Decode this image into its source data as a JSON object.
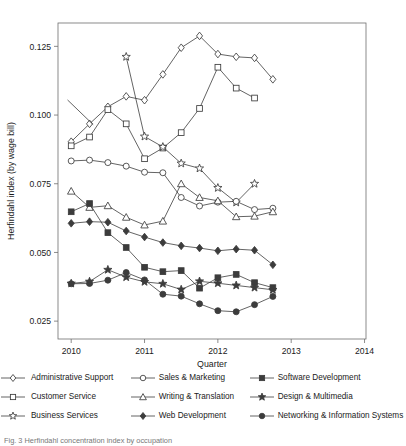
{
  "chart_data": {
    "type": "line",
    "title": "",
    "xlabel": "Quarter",
    "ylabel": "Herfindahl index (by wage bill)",
    "xlim": [
      2009.82,
      2014.02
    ],
    "ylim": [
      0.0185,
      0.1335
    ],
    "xticks": [
      2010,
      2011,
      2012,
      2013,
      2014
    ],
    "xticklabels": [
      "2010",
      "2011",
      "2012",
      "2013",
      "2014"
    ],
    "yticks": [
      0.025,
      0.05,
      0.075,
      0.1,
      0.125
    ],
    "yticklabels": [
      "0.025",
      "0.050",
      "0.075",
      "0.100",
      "0.125"
    ],
    "grid": false,
    "legend_position": "below",
    "annotation_leader_line": {
      "x1": 2009.95,
      "y1": 0.1055,
      "x2": 2010.3,
      "y2": 0.0965
    },
    "x": [
      2010.0,
      2010.25,
      2010.5,
      2010.75,
      2011.0,
      2011.25,
      2011.5,
      2011.75,
      2012.0,
      2012.25,
      2012.5,
      2012.75
    ],
    "series": [
      {
        "name": "Administrative Support",
        "marker": "open-diamond",
        "values": [
          0.0903,
          0.0968,
          0.103,
          0.1068,
          0.1054,
          0.1148,
          0.1245,
          0.1288,
          0.1222,
          0.1212,
          0.1208,
          0.113
        ]
      },
      {
        "name": "Customer Service",
        "marker": "open-square",
        "values": [
          0.0888,
          0.092,
          0.102,
          0.0968,
          0.0841,
          0.088,
          0.0936,
          0.1024,
          0.1174,
          0.1098,
          0.1062,
          null
        ]
      },
      {
        "name": "Business Services",
        "marker": "open-star",
        "values": [
          null,
          null,
          null,
          0.1212,
          0.0922,
          0.0884,
          0.0824,
          0.0806,
          0.0735,
          0.0682,
          0.075,
          null
        ]
      },
      {
        "name": "Sales & Marketing",
        "marker": "open-circle",
        "values": [
          0.0833,
          0.0836,
          0.0827,
          0.0814,
          0.0792,
          0.079,
          0.07,
          0.0669,
          0.0683,
          0.0686,
          0.0656,
          0.0661
        ]
      },
      {
        "name": "Writing & Translation",
        "marker": "open-triangle",
        "values": [
          0.0723,
          0.0664,
          0.067,
          0.0628,
          0.06,
          0.0614,
          0.075,
          0.07,
          0.0688,
          0.063,
          0.0632,
          0.0648
        ]
      },
      {
        "name": "Web Development",
        "marker": "filled-diamond",
        "values": [
          0.0606,
          0.0612,
          0.061,
          0.0578,
          0.0556,
          0.0536,
          0.0524,
          0.0516,
          0.0506,
          0.0512,
          0.0508,
          0.0455
        ]
      },
      {
        "name": "Software Development",
        "marker": "filled-square",
        "values": [
          0.0648,
          0.0678,
          0.0572,
          0.0518,
          0.0446,
          0.043,
          0.0434,
          0.037,
          0.0408,
          0.042,
          0.039,
          0.0372
        ]
      },
      {
        "name": "Design & Multimedia",
        "marker": "filled-star",
        "values": [
          0.0387,
          0.0394,
          0.0437,
          0.041,
          0.0393,
          0.0386,
          0.0365,
          0.0395,
          0.0388,
          0.038,
          0.0372,
          0.0364
        ]
      },
      {
        "name": "Networking & Information Systems",
        "marker": "filled-circle",
        "values": [
          0.0386,
          0.0387,
          0.0399,
          0.0427,
          0.04,
          0.0348,
          0.0341,
          0.0313,
          0.0288,
          0.0284,
          0.031,
          0.034
        ]
      }
    ]
  },
  "legend": {
    "rows": [
      [
        {
          "marker": "open-diamond",
          "label": "Administrative Support"
        },
        {
          "marker": "open-circle",
          "label": "Sales & Marketing"
        },
        {
          "marker": "filled-square",
          "label": "Software Development"
        }
      ],
      [
        {
          "marker": "open-square",
          "label": "Customer Service"
        },
        {
          "marker": "open-triangle",
          "label": "Writing & Translation"
        },
        {
          "marker": "filled-star",
          "label": "Design & Multimedia"
        }
      ],
      [
        {
          "marker": "open-star",
          "label": "Business Services"
        },
        {
          "marker": "filled-diamond",
          "label": "Web Development"
        },
        {
          "marker": "filled-circle",
          "label": "Networking & Information Systems"
        }
      ]
    ]
  },
  "caption": "Fig. 3  Herfindahl concentration index by occupation",
  "colors": {
    "line": "#3c3c3c",
    "axis": "#6e6e6e",
    "text": "#1a1a1a"
  }
}
